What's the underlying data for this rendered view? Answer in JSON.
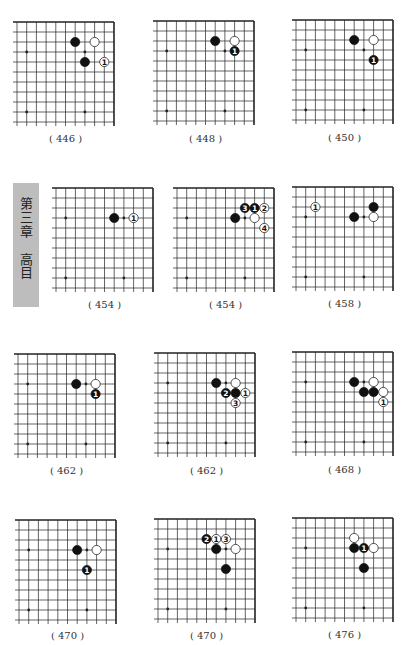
{
  "side_tab": {
    "chapter": "第三章",
    "topic": "高目"
  },
  "colors": {
    "black_stone": "#111111",
    "white_stone": "#ffffff",
    "grid": "#222222",
    "tab": "#bdbdbd"
  },
  "grid": {
    "cols": 11,
    "rows": 11,
    "dx": 9.7,
    "dy": 10,
    "star_points": [
      [
        3,
        3
      ],
      [
        9,
        3
      ],
      [
        3,
        9
      ],
      [
        9,
        9
      ]
    ]
  },
  "diagrams": [
    {
      "caption": "( 446 )",
      "right": 114,
      "top": 22,
      "stones": [
        {
          "c": 4,
          "r": 2,
          "color": "black"
        },
        {
          "c": 2,
          "r": 2,
          "color": "white"
        },
        {
          "c": 3,
          "r": 4,
          "color": "black"
        },
        {
          "c": 1,
          "r": 4,
          "color": "white",
          "label": "1"
        }
      ]
    },
    {
      "caption": "( 448 )",
      "right": 254,
      "top": 21,
      "stones": [
        {
          "c": 4,
          "r": 2,
          "color": "black"
        },
        {
          "c": 2,
          "r": 2,
          "color": "white"
        },
        {
          "c": 2,
          "r": 3,
          "color": "black",
          "label": "1"
        }
      ]
    },
    {
      "caption": "( 450 )",
      "right": 393,
      "top": 20,
      "stones": [
        {
          "c": 4,
          "r": 2,
          "color": "black"
        },
        {
          "c": 2,
          "r": 2,
          "color": "white"
        },
        {
          "c": 2,
          "r": 4,
          "color": "black",
          "label": "1"
        }
      ]
    },
    {
      "caption": "( 454 )",
      "right": 153,
      "top": 188,
      "stones": [
        {
          "c": 4,
          "r": 3,
          "color": "black"
        },
        {
          "c": 2,
          "r": 3,
          "color": "white",
          "label": "1"
        }
      ]
    },
    {
      "caption": "( 454 )",
      "right": 274,
      "top": 188,
      "stones": [
        {
          "c": 4,
          "r": 3,
          "color": "black"
        },
        {
          "c": 3,
          "r": 2,
          "color": "black",
          "label": "3"
        },
        {
          "c": 2,
          "r": 2,
          "color": "black",
          "label": "1"
        },
        {
          "c": 1,
          "r": 2,
          "color": "white",
          "label": "2"
        },
        {
          "c": 2,
          "r": 3,
          "color": "white"
        },
        {
          "c": 1,
          "r": 4,
          "color": "white",
          "label": "4"
        }
      ]
    },
    {
      "caption": "( 458 )",
      "right": 393,
      "top": 187,
      "stones": [
        {
          "c": 8,
          "r": 2,
          "color": "white",
          "label": "1"
        },
        {
          "c": 4,
          "r": 3,
          "color": "black"
        },
        {
          "c": 2,
          "r": 3,
          "color": "white"
        },
        {
          "c": 2,
          "r": 2,
          "color": "black"
        }
      ]
    },
    {
      "caption": "( 462 )",
      "right": 115,
      "top": 354,
      "stones": [
        {
          "c": 4,
          "r": 3,
          "color": "black"
        },
        {
          "c": 2,
          "r": 3,
          "color": "white"
        },
        {
          "c": 2,
          "r": 4,
          "color": "black",
          "label": "1"
        }
      ]
    },
    {
      "caption": "( 462 )",
      "right": 255,
      "top": 353,
      "stones": [
        {
          "c": 4,
          "r": 3,
          "color": "black"
        },
        {
          "c": 2,
          "r": 3,
          "color": "white"
        },
        {
          "c": 3,
          "r": 4,
          "color": "black",
          "label": "2"
        },
        {
          "c": 2,
          "r": 4,
          "color": "black"
        },
        {
          "c": 1,
          "r": 4,
          "color": "white",
          "label": "1"
        },
        {
          "c": 2,
          "r": 5,
          "color": "white",
          "label": "3"
        }
      ]
    },
    {
      "caption": "( 468 )",
      "right": 393,
      "top": 352,
      "stones": [
        {
          "c": 4,
          "r": 3,
          "color": "black"
        },
        {
          "c": 2,
          "r": 3,
          "color": "white"
        },
        {
          "c": 3,
          "r": 4,
          "color": "black"
        },
        {
          "c": 2,
          "r": 4,
          "color": "black"
        },
        {
          "c": 1,
          "r": 4,
          "color": "white"
        },
        {
          "c": 1,
          "r": 5,
          "color": "white",
          "label": "1"
        }
      ]
    },
    {
      "caption": "( 470 )",
      "right": 116,
      "top": 520,
      "stones": [
        {
          "c": 4,
          "r": 3,
          "color": "black"
        },
        {
          "c": 2,
          "r": 3,
          "color": "white"
        },
        {
          "c": 3,
          "r": 5,
          "color": "black",
          "label": "1"
        }
      ]
    },
    {
      "caption": "( 470 )",
      "right": 255,
      "top": 519,
      "stones": [
        {
          "c": 5,
          "r": 2,
          "color": "black",
          "label": "2"
        },
        {
          "c": 4,
          "r": 2,
          "color": "white",
          "label": "1"
        },
        {
          "c": 3,
          "r": 2,
          "color": "white",
          "label": "3"
        },
        {
          "c": 4,
          "r": 3,
          "color": "black"
        },
        {
          "c": 2,
          "r": 3,
          "color": "white"
        },
        {
          "c": 3,
          "r": 5,
          "color": "black"
        }
      ]
    },
    {
      "caption": "( 476 )",
      "right": 393,
      "top": 518,
      "stones": [
        {
          "c": 4,
          "r": 2,
          "color": "white"
        },
        {
          "c": 4,
          "r": 3,
          "color": "black"
        },
        {
          "c": 3,
          "r": 3,
          "color": "black",
          "label": "1"
        },
        {
          "c": 2,
          "r": 3,
          "color": "white"
        },
        {
          "c": 3,
          "r": 5,
          "color": "black"
        }
      ]
    }
  ],
  "captions_y": [
    140,
    140,
    139,
    306,
    306,
    305,
    472,
    472,
    471,
    637,
    637,
    636
  ]
}
